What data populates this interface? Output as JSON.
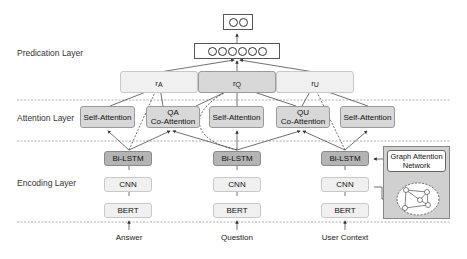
{
  "layers": {
    "prediction": "Predication Layer",
    "attention": "Attention Layer",
    "encoding": "Encoding Layer"
  },
  "output": {
    "final_circles": 2,
    "hidden_circles": 6
  },
  "representations": [
    {
      "label": "r",
      "sup": "A",
      "shade": "light"
    },
    {
      "label": "r",
      "sup": "Q",
      "shade": "mid"
    },
    {
      "label": "r",
      "sup": "U",
      "shade": "light"
    }
  ],
  "attention_blocks": [
    {
      "label": "Self-Attention"
    },
    {
      "label_line1": "QA",
      "label_line2": "Co-Attention"
    },
    {
      "label": "Self-Attention"
    },
    {
      "label_line1": "QU",
      "label_line2": "Co-Attention"
    },
    {
      "label": "Self-Attention"
    }
  ],
  "encoders": [
    {
      "bilstm": "Bi-LSTM",
      "cnn": "CNN",
      "bert": "BERT",
      "input": "Answer"
    },
    {
      "bilstm": "Bi-LSTM",
      "cnn": "CNN",
      "bert": "BERT",
      "input": "Question"
    },
    {
      "bilstm": "Bi-LSTM",
      "cnn": "CNN",
      "bert": "BERT",
      "input": "User Context"
    }
  ],
  "gat": {
    "label_line1": "Graph Attention",
    "label_line2": "Network"
  },
  "colors": {
    "light_fill": "#f0f0f0",
    "mid_fill": "#d8d8d8",
    "dark_fill": "#b4b4b4",
    "gat_panel": "#d0d0d0",
    "divider": "#999999"
  }
}
